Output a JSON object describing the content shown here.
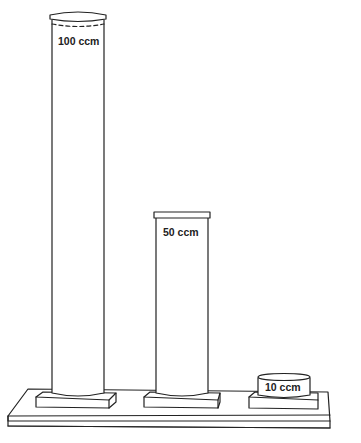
{
  "diagram": {
    "type": "volume-comparison-cylinders",
    "colors": {
      "stroke": "#222222",
      "background": "#ffffff"
    },
    "cylinders": [
      {
        "id": "large",
        "label": "100 ccm",
        "volume": 100,
        "unit": "ccm"
      },
      {
        "id": "medium",
        "label": "50 ccm",
        "volume": 50,
        "unit": "ccm"
      },
      {
        "id": "small",
        "label": "10 ccm",
        "volume": 10,
        "unit": "ccm"
      }
    ]
  }
}
